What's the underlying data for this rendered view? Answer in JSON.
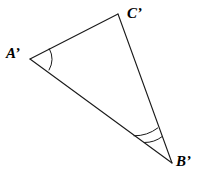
{
  "figure": {
    "type": "geometry-diagram",
    "shape": "triangle",
    "background_color": "#ffffff",
    "stroke_color": "#1a1a1a",
    "caption_text": "",
    "vertices": [
      {
        "id": "A",
        "label": "A’",
        "x": 30,
        "y": 59,
        "label_x": 6,
        "label_y": 46
      },
      {
        "id": "C",
        "label": "C’",
        "x": 118,
        "y": 14,
        "label_x": 127,
        "label_y": 6
      },
      {
        "id": "B",
        "label": "B’",
        "x": 172,
        "y": 163,
        "label_x": 176,
        "label_y": 154
      }
    ],
    "edges": [
      {
        "from": "A",
        "to": "C"
      },
      {
        "from": "C",
        "to": "B"
      },
      {
        "from": "B",
        "to": "A"
      }
    ],
    "angle_marks": [
      {
        "at": "A",
        "arc_count": 1,
        "radii": [
          22
        ]
      },
      {
        "at": "B",
        "arc_count": 2,
        "radii": [
          28,
          38
        ]
      }
    ]
  }
}
